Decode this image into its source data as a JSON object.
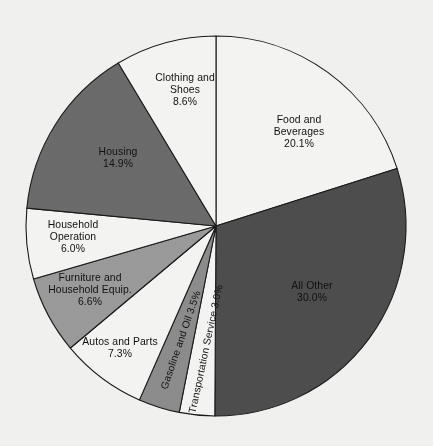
{
  "chart_data": {
    "type": "pie",
    "title": "",
    "subtitle": "",
    "xlabel": "",
    "ylabel": "",
    "legend_position": "none",
    "grid": false,
    "labels_inside": true,
    "start_angle_deg": 0,
    "direction": "clockwise",
    "units": "percent",
    "total": 100.0,
    "categories": [
      "Food and Beverages",
      "All Other",
      "Transportation Service",
      "Gasoline and Oil",
      "Autos and Parts",
      "Furniture and Household Equip.",
      "Household Operation",
      "Housing",
      "Clothing and Shoes"
    ],
    "values": [
      20.1,
      30.0,
      3.0,
      3.5,
      7.3,
      6.6,
      6.0,
      14.9,
      8.6
    ],
    "slices": [
      {
        "name": "Food and Beverages",
        "value": 20.1,
        "value_label": "20.1%",
        "label_line1": "Food and",
        "label_line2": "Beverages",
        "label_line3": "20.1%",
        "color": "#f4f4f2",
        "text_color": "#111111",
        "rotated": false
      },
      {
        "name": "All Other",
        "value": 30.0,
        "value_label": "30.0%",
        "label_line1": "All Other",
        "label_line2": "30.0%",
        "label_line3": "",
        "color": "#4d4d4d",
        "text_color": "#111111",
        "rotated": false
      },
      {
        "name": "Transportation Service",
        "value": 3.0,
        "value_label": "3.0%",
        "label_line1": "Transportation Service 3.0%",
        "label_line2": "",
        "label_line3": "",
        "color": "#f4f4f2",
        "text_color": "#111111",
        "rotated": true
      },
      {
        "name": "Gasoline and Oil",
        "value": 3.5,
        "value_label": "3.5%",
        "label_line1": "Gasoline and Oil 3.5%",
        "label_line2": "",
        "label_line3": "",
        "color": "#8c8c8c",
        "text_color": "#111111",
        "rotated": true
      },
      {
        "name": "Autos and Parts",
        "value": 7.3,
        "value_label": "7.3%",
        "label_line1": "Autos and Parts",
        "label_line2": "7.3%",
        "label_line3": "",
        "color": "#f4f4f2",
        "text_color": "#111111",
        "rotated": false
      },
      {
        "name": "Furniture and Household Equip.",
        "value": 6.6,
        "value_label": "6.6%",
        "label_line1": "Furniture and",
        "label_line2": "Household Equip.",
        "label_line3": "6.6%",
        "color": "#9a9a9a",
        "text_color": "#111111",
        "rotated": false
      },
      {
        "name": "Household Operation",
        "value": 6.0,
        "value_label": "6.0%",
        "label_line1": "Household",
        "label_line2": "Operation",
        "label_line3": "6.0%",
        "color": "#f4f4f2",
        "text_color": "#111111",
        "rotated": false
      },
      {
        "name": "Housing",
        "value": 14.9,
        "value_label": "14.9%",
        "label_line1": "Housing",
        "label_line2": "14.9%",
        "label_line3": "",
        "color": "#6b6b6b",
        "text_color": "#111111",
        "rotated": false
      },
      {
        "name": "Clothing and Shoes",
        "value": 8.6,
        "value_label": "8.6%",
        "label_line1": "Clothing and",
        "label_line2": "Shoes",
        "label_line3": "8.6%",
        "color": "#f4f4f2",
        "text_color": "#111111",
        "rotated": false
      }
    ],
    "colors": {
      "background": "#f1f1ef",
      "outline": "#1b1b1b",
      "dark_slice": "#4d4d4d",
      "mid_slice": "#6b6b6b",
      "light_slice": "#9a9a9a",
      "white_slice": "#f4f4f2"
    },
    "geometry": {
      "center_x": 216,
      "center_y": 226,
      "radius": 190
    },
    "label_positions": [
      {
        "name": "Food and Beverages",
        "x": 299,
        "y": 132,
        "rotate": 0
      },
      {
        "name": "All Other",
        "x": 312,
        "y": 292,
        "rotate": 0
      },
      {
        "name": "Transportation Service",
        "x": 206,
        "y": 349,
        "rotate": -78
      },
      {
        "name": "Gasoline and Oil",
        "x": 181,
        "y": 340,
        "rotate": -71
      },
      {
        "name": "Autos and Parts",
        "x": 120,
        "y": 348,
        "rotate": 0
      },
      {
        "name": "Furniture and Household Equip.",
        "x": 90,
        "y": 290,
        "rotate": 0
      },
      {
        "name": "Household Operation",
        "x": 73,
        "y": 237,
        "rotate": 0
      },
      {
        "name": "Housing",
        "x": 118,
        "y": 158,
        "rotate": 0
      },
      {
        "name": "Clothing and Shoes",
        "x": 185,
        "y": 90,
        "rotate": 0
      }
    ]
  }
}
